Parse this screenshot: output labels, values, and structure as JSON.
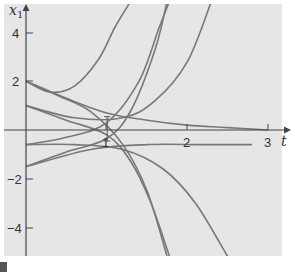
{
  "chart_data": {
    "type": "line",
    "title": "",
    "xlabel": "t",
    "ylabel": "x1",
    "xlim": [
      -0.25,
      3.15
    ],
    "ylim": [
      -5.2,
      5.3
    ],
    "grid": false,
    "legend": null,
    "x_ticks": [
      1,
      2,
      3
    ],
    "y_ticks": [
      4,
      2,
      -2,
      -4
    ],
    "x_tick_labels": [
      "1",
      "2",
      "3"
    ],
    "y_tick_labels": [
      "4",
      "2",
      "−2",
      "−4"
    ],
    "colors": {
      "background": "#e8e8e8",
      "curve": "#777777",
      "axis": "#444444"
    },
    "series": [
      {
        "name": "curve-1",
        "points": [
          [
            0,
            2.0
          ],
          [
            0.3,
            1.55
          ],
          [
            0.6,
            1.8
          ],
          [
            0.9,
            2.9
          ],
          [
            1.1,
            4.2
          ],
          [
            1.3,
            5.3
          ]
        ]
      },
      {
        "name": "curve-2",
        "points": [
          [
            0,
            2.0
          ],
          [
            0.5,
            1.3
          ],
          [
            1.0,
            0.7
          ],
          [
            1.5,
            0.4
          ],
          [
            2.0,
            0.2
          ],
          [
            2.5,
            0.1
          ],
          [
            3.0,
            0.0
          ]
        ]
      },
      {
        "name": "curve-3",
        "points": [
          [
            0,
            2.0
          ],
          [
            0.4,
            1.4
          ],
          [
            0.8,
            0.75
          ],
          [
            1.2,
            -0.6
          ],
          [
            1.5,
            -2.5
          ],
          [
            1.75,
            -5.2
          ]
        ]
      },
      {
        "name": "curve-4",
        "points": [
          [
            0,
            1.0
          ],
          [
            0.5,
            0.4
          ],
          [
            1.0,
            -0.2
          ],
          [
            1.3,
            -1.3
          ],
          [
            1.55,
            -3.0
          ],
          [
            1.78,
            -5.2
          ]
        ]
      },
      {
        "name": "curve-5",
        "points": [
          [
            0,
            1.0
          ],
          [
            0.6,
            0.5
          ],
          [
            1.2,
            0.5
          ],
          [
            1.6,
            1.2
          ],
          [
            2.0,
            2.8
          ],
          [
            2.3,
            5.3
          ]
        ]
      },
      {
        "name": "curve-6",
        "points": [
          [
            0,
            -0.6
          ],
          [
            0.5,
            -0.3
          ],
          [
            1.0,
            0.3
          ],
          [
            1.4,
            2.0
          ],
          [
            1.65,
            4.2
          ],
          [
            1.78,
            5.3
          ]
        ]
      },
      {
        "name": "curve-7",
        "points": [
          [
            0,
            -1.5
          ],
          [
            0.5,
            -0.9
          ],
          [
            1.0,
            -0.35
          ],
          [
            1.3,
            0.8
          ],
          [
            1.6,
            3.3
          ],
          [
            1.75,
            5.3
          ]
        ]
      },
      {
        "name": "curve-8",
        "points": [
          [
            0,
            -0.6
          ],
          [
            0.6,
            -0.6
          ],
          [
            1.2,
            -0.8
          ],
          [
            1.7,
            -1.6
          ],
          [
            2.1,
            -3.0
          ],
          [
            2.5,
            -5.2
          ]
        ]
      },
      {
        "name": "curve-9",
        "points": [
          [
            0,
            -1.5
          ],
          [
            0.8,
            -0.8
          ],
          [
            1.5,
            -0.6
          ],
          [
            2.2,
            -0.6
          ],
          [
            2.8,
            -0.6
          ]
        ]
      }
    ],
    "annotations": [
      {
        "type": "vertical-segment",
        "x": 1.0,
        "y_from": 0.55,
        "y_to": -0.45
      }
    ]
  },
  "axes": {
    "x_label": "t",
    "y_label": "x",
    "y_label_sub": "1",
    "x_ticks": [
      "1",
      "2",
      "3"
    ],
    "y_ticks": [
      "4",
      "2",
      "−2",
      "−4"
    ]
  }
}
